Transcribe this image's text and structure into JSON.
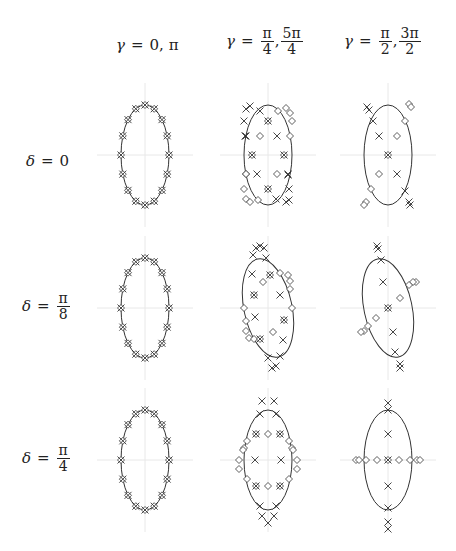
{
  "column_headers": [
    {
      "var": "γ",
      "eq": "=",
      "parts": [
        {
          "type": "text",
          "v": "0, π"
        }
      ]
    },
    {
      "var": "γ",
      "eq": "=",
      "parts": [
        {
          "type": "frac",
          "num": "π",
          "den": "4"
        },
        {
          "type": "text",
          "v": ","
        },
        {
          "type": "frac",
          "num": "5π",
          "den": "4"
        }
      ]
    },
    {
      "var": "γ",
      "eq": "=",
      "parts": [
        {
          "type": "frac",
          "num": "π",
          "den": "2"
        },
        {
          "type": "text",
          "v": ","
        },
        {
          "type": "frac",
          "num": "3π",
          "den": "2"
        }
      ]
    }
  ],
  "row_headers": [
    {
      "var": "δ",
      "eq": "=",
      "parts": [
        {
          "type": "text",
          "v": "0"
        }
      ]
    },
    {
      "var": "δ",
      "eq": "=",
      "parts": [
        {
          "type": "frac",
          "num": "π",
          "den": "8"
        }
      ]
    },
    {
      "var": "δ",
      "eq": "=",
      "parts": [
        {
          "type": "frac",
          "num": "π",
          "den": "4"
        }
      ]
    }
  ],
  "colors": {
    "ink": "#333333",
    "axis": "#e8e8e8",
    "text": "#222222"
  },
  "grid": {
    "col_centers": [
      145,
      268,
      388
    ],
    "row_centers": [
      155,
      308,
      460
    ],
    "ellipse_rx": 24,
    "ellipse_ry": 50
  },
  "panels": [
    {
      "row": 0,
      "col": 0,
      "tilt": 0,
      "markers": "ring16"
    },
    {
      "row": 0,
      "col": 1,
      "tilt": 0,
      "markers": [
        [
          "x",
          -22,
          -46
        ],
        [
          "x",
          -18,
          -49
        ],
        [
          "x",
          -8,
          -44
        ],
        [
          "x",
          -24,
          -34
        ],
        [
          "x",
          -22,
          -19
        ],
        [
          "x",
          9,
          -19
        ],
        [
          "x",
          -11,
          19
        ],
        [
          "x",
          20,
          19
        ],
        [
          "x",
          21,
          34
        ],
        [
          "x",
          8,
          44
        ],
        [
          "x",
          18,
          47
        ],
        [
          "x",
          21,
          45
        ],
        [
          "x",
          20,
          20
        ],
        [
          "d",
          10,
          -44
        ],
        [
          "d",
          18,
          -47
        ],
        [
          "d",
          22,
          -42
        ],
        [
          "d",
          24,
          -34
        ],
        [
          "d",
          -8,
          -19
        ],
        [
          "d",
          22,
          -19
        ],
        [
          "d",
          -22,
          19
        ],
        [
          "d",
          9,
          19
        ],
        [
          "d",
          -24,
          34
        ],
        [
          "d",
          -22,
          44
        ],
        [
          "d",
          -18,
          47
        ],
        [
          "d",
          -10,
          45
        ],
        [
          "s",
          0,
          -34
        ],
        [
          "s",
          -16,
          0
        ],
        [
          "s",
          16,
          0
        ],
        [
          "s",
          0,
          34
        ],
        [
          "d",
          -22,
          19
        ],
        [
          "x",
          -23,
          -19
        ]
      ]
    },
    {
      "row": 0,
      "col": 2,
      "tilt": 0,
      "markers": [
        [
          "x",
          -21,
          -48
        ],
        [
          "x",
          -19,
          -45
        ],
        [
          "x",
          -15,
          -34
        ],
        [
          "x",
          -9,
          -19
        ],
        [
          "x",
          9,
          19
        ],
        [
          "x",
          17,
          36
        ],
        [
          "x",
          21,
          47
        ],
        [
          "x",
          22,
          50
        ],
        [
          "d",
          21,
          -51
        ],
        [
          "d",
          23,
          -48
        ],
        [
          "d",
          17,
          -34
        ],
        [
          "d",
          9,
          -19
        ],
        [
          "d",
          -9,
          19
        ],
        [
          "d",
          -17,
          34
        ],
        [
          "d",
          -22,
          47
        ],
        [
          "d",
          -24,
          50
        ],
        [
          "s",
          0,
          0
        ]
      ]
    },
    {
      "row": 1,
      "col": 0,
      "tilt": 0,
      "markers": "ring16"
    },
    {
      "row": 1,
      "col": 1,
      "tilt": -12,
      "markers": [
        [
          "x",
          -12,
          -60
        ],
        [
          "x",
          -8,
          -62
        ],
        [
          "x",
          -4,
          -60
        ],
        [
          "x",
          -15,
          -53
        ],
        [
          "x",
          -2,
          -50
        ],
        [
          "x",
          -16,
          -34
        ],
        [
          "x",
          12,
          -13
        ],
        [
          "x",
          -13,
          9
        ],
        [
          "x",
          15,
          32
        ],
        [
          "x",
          12,
          48
        ],
        [
          "x",
          8,
          58
        ],
        [
          "x",
          4,
          60
        ],
        [
          "x",
          0,
          50
        ],
        [
          "d",
          12,
          -35
        ],
        [
          "d",
          20,
          -33
        ],
        [
          "d",
          22,
          -27
        ],
        [
          "d",
          22,
          -19
        ],
        [
          "d",
          -5,
          -26
        ],
        [
          "d",
          -22,
          13
        ],
        [
          "d",
          -22,
          23
        ],
        [
          "d",
          -19,
          30
        ],
        [
          "d",
          -14,
          31
        ],
        [
          "d",
          5,
          24
        ],
        [
          "d",
          -24,
          0
        ],
        [
          "d",
          24,
          0
        ],
        [
          "s",
          2,
          -33
        ],
        [
          "s",
          -14,
          -13
        ],
        [
          "s",
          16,
          12
        ],
        [
          "s",
          -8,
          31
        ]
      ]
    },
    {
      "row": 1,
      "col": 2,
      "tilt": -12,
      "markers": [
        [
          "x",
          -11,
          -62
        ],
        [
          "x",
          -10,
          -59
        ],
        [
          "x",
          -7,
          -48
        ],
        [
          "x",
          -5,
          -26
        ],
        [
          "x",
          5,
          24
        ],
        [
          "x",
          7,
          44
        ],
        [
          "x",
          12,
          56
        ],
        [
          "x",
          12,
          60
        ],
        [
          "d",
          28,
          -26
        ],
        [
          "d",
          25,
          -26
        ],
        [
          "d",
          21,
          -23
        ],
        [
          "d",
          12,
          -10
        ],
        [
          "d",
          -12,
          10
        ],
        [
          "d",
          -20,
          18
        ],
        [
          "d",
          -24,
          23
        ],
        [
          "d",
          -27,
          24
        ],
        [
          "s",
          0,
          0
        ]
      ]
    },
    {
      "row": 2,
      "col": 0,
      "tilt": 0,
      "markers": "ring16"
    },
    {
      "row": 2,
      "col": 1,
      "tilt": 0,
      "markers": [
        [
          "x",
          -6,
          -59
        ],
        [
          "x",
          6,
          -59
        ],
        [
          "x",
          -8,
          -46
        ],
        [
          "x",
          8,
          -46
        ],
        [
          "x",
          -13,
          0
        ],
        [
          "x",
          13,
          0
        ],
        [
          "x",
          -8,
          46
        ],
        [
          "x",
          8,
          46
        ],
        [
          "x",
          -6,
          56
        ],
        [
          "x",
          6,
          56
        ],
        [
          "x",
          0,
          63
        ],
        [
          "d",
          0,
          -26
        ],
        [
          "d",
          0,
          26
        ],
        [
          "d",
          -21,
          -19
        ],
        [
          "d",
          21,
          -19
        ],
        [
          "d",
          -24,
          -12
        ],
        [
          "d",
          24,
          -12
        ],
        [
          "d",
          -29,
          0
        ],
        [
          "d",
          29,
          0
        ],
        [
          "d",
          -29,
          9
        ],
        [
          "d",
          29,
          9
        ],
        [
          "d",
          -21,
          19
        ],
        [
          "d",
          21,
          19
        ],
        [
          "d",
          -25,
          -10
        ],
        [
          "d",
          25,
          -10
        ],
        [
          "s",
          -12,
          -26
        ],
        [
          "s",
          12,
          -26
        ],
        [
          "s",
          -12,
          26
        ],
        [
          "s",
          12,
          26
        ]
      ]
    },
    {
      "row": 2,
      "col": 2,
      "tilt": 0,
      "markers": [
        [
          "x",
          0,
          -50
        ],
        [
          "x",
          0,
          -26
        ],
        [
          "x",
          0,
          26
        ],
        [
          "x",
          0,
          48
        ],
        [
          "x",
          0,
          62
        ],
        [
          "x",
          0,
          69
        ],
        [
          "x",
          0,
          -57
        ],
        [
          "d",
          -32,
          0
        ],
        [
          "d",
          -29,
          0
        ],
        [
          "d",
          -22,
          0
        ],
        [
          "d",
          -11,
          0
        ],
        [
          "d",
          11,
          0
        ],
        [
          "d",
          22,
          0
        ],
        [
          "d",
          29,
          0
        ],
        [
          "d",
          32,
          0
        ],
        [
          "s",
          0,
          0
        ]
      ]
    }
  ]
}
